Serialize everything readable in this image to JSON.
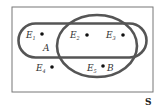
{
  "diagram": {
    "type": "venn",
    "universe_label": "S",
    "sets": [
      {
        "name": "A",
        "shape": "stadium",
        "label": "A"
      },
      {
        "name": "B",
        "shape": "circle",
        "label": "B"
      }
    ],
    "points": [
      {
        "name": "E1",
        "base": "E",
        "sub": "1"
      },
      {
        "name": "E2",
        "base": "E",
        "sub": "2"
      },
      {
        "name": "E3",
        "base": "E",
        "sub": "3"
      },
      {
        "name": "E4",
        "base": "E",
        "sub": "4"
      },
      {
        "name": "E5",
        "base": "E",
        "sub": "5"
      }
    ],
    "colors": {
      "outline": "#555555",
      "frame": "#777777",
      "text": "#333333"
    }
  }
}
